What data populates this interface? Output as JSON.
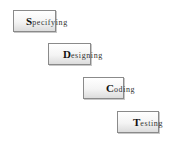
{
  "diagram": {
    "type": "waterfall",
    "steps": [
      {
        "initial": "S",
        "rest": "pecifying",
        "label": "Specifying"
      },
      {
        "initial": "D",
        "rest": "esigning",
        "label": "Designing"
      },
      {
        "initial": "C",
        "rest": "oding",
        "label": "Coding"
      },
      {
        "initial": "T",
        "rest": "esting",
        "label": "Testing"
      }
    ]
  }
}
